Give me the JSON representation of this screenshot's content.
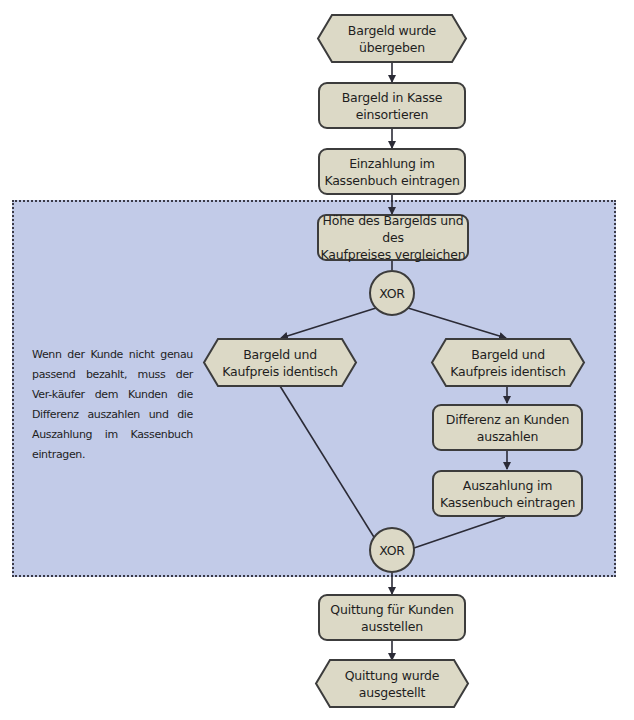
{
  "diagram": {
    "type": "EPK (event-driven process chain)",
    "colors": {
      "node_fill": "#dcd9c6",
      "node_border": "#3c3c3c",
      "region_fill": "#c2cbe8",
      "connector": "#2b2b36"
    },
    "nodes": {
      "start_event": {
        "kind": "event",
        "label": "Bargeld wurde\nübergeben"
      },
      "fn_sort_cash": {
        "kind": "function",
        "label": "Bargeld in Kasse\neinsortieren"
      },
      "fn_record_deposit": {
        "kind": "function",
        "label": "Einzahlung im\nKassenbuch eintragen"
      },
      "fn_compare": {
        "kind": "function",
        "label": "Höhe des Bargelds und des\nKaufpreises vergleichen"
      },
      "xor_split": {
        "kind": "gateway",
        "label": "XOR"
      },
      "event_left": {
        "kind": "event",
        "label": "Bargeld und\nKaufpreis identisch"
      },
      "event_right": {
        "kind": "event",
        "label": "Bargeld und\nKaufpreis identisch"
      },
      "fn_pay_difference": {
        "kind": "function",
        "label": "Differenz an Kunden\nauszahlen"
      },
      "fn_record_payout": {
        "kind": "function",
        "label": "Auszahlung im\nKassenbuch eintragen"
      },
      "xor_join": {
        "kind": "gateway",
        "label": "XOR"
      },
      "fn_issue_receipt": {
        "kind": "function",
        "label": "Quittung für Kunden\nausstellen"
      },
      "end_event": {
        "kind": "event",
        "label": "Quittung wurde\nausgestellt"
      }
    },
    "edges": [
      [
        "start_event",
        "fn_sort_cash"
      ],
      [
        "fn_sort_cash",
        "fn_record_deposit"
      ],
      [
        "fn_record_deposit",
        "fn_compare"
      ],
      [
        "fn_compare",
        "xor_split"
      ],
      [
        "xor_split",
        "event_left"
      ],
      [
        "xor_split",
        "event_right"
      ],
      [
        "event_right",
        "fn_pay_difference"
      ],
      [
        "fn_pay_difference",
        "fn_record_payout"
      ],
      [
        "event_left",
        "xor_join"
      ],
      [
        "fn_record_payout",
        "xor_join"
      ],
      [
        "xor_join",
        "fn_issue_receipt"
      ],
      [
        "fn_issue_receipt",
        "end_event"
      ]
    ],
    "annotation": "Wenn der Kunde nicht genau passend bezahlt, muss der Ver-käufer dem Kunden die Differenz auszahlen und die Auszahlung im Kassenbuch eintragen."
  }
}
